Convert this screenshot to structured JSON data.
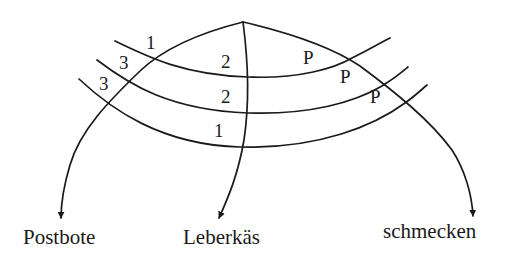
{
  "diagram": {
    "type": "constituent-arc-diagram",
    "targets": [
      {
        "id": "postbote",
        "label": "Postbote"
      },
      {
        "id": "leberkaes",
        "label": "Leberkäs"
      },
      {
        "id": "schmecken",
        "label": "schmecken"
      }
    ],
    "arcs": [
      {
        "id": "arc-1",
        "labels": {
          "left": "1",
          "middle": "2",
          "right": "P"
        }
      },
      {
        "id": "arc-2",
        "labels": {
          "left": "3",
          "middle": "2",
          "right": "P"
        }
      },
      {
        "id": "arc-3",
        "labels": {
          "left": "3",
          "middle": "1",
          "right": "P"
        }
      }
    ],
    "colors": {
      "ink": "#1a1a1a",
      "background": "#ffffff"
    }
  }
}
